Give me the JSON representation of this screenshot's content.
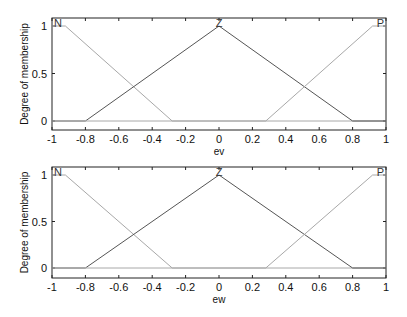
{
  "chart_data": [
    {
      "type": "line",
      "title": "",
      "xlabel": "ev",
      "ylabel": "Degree of membership",
      "xlim": [
        -1,
        1
      ],
      "ylim": [
        0,
        1
      ],
      "xticks": [
        "-1",
        "-0.8",
        "-0.6",
        "-0.4",
        "-0.2",
        "0",
        "0.2",
        "0.4",
        "0.6",
        "0.8",
        "1"
      ],
      "yticks": [
        "0",
        "0.5",
        "1"
      ],
      "grid": false,
      "series": [
        {
          "name": "N",
          "x": [
            -1,
            -0.92,
            -0.28,
            1
          ],
          "y": [
            1,
            1,
            0,
            0
          ],
          "color": "#a8a8a8"
        },
        {
          "name": "Z",
          "x": [
            -1,
            -0.8,
            0,
            0.8,
            1
          ],
          "y": [
            0,
            0,
            1,
            0,
            0
          ],
          "color": "#555555"
        },
        {
          "name": "P",
          "x": [
            -1,
            0.28,
            0.92,
            1
          ],
          "y": [
            0,
            0,
            1,
            1
          ],
          "color": "#a8a8a8"
        }
      ]
    },
    {
      "type": "line",
      "title": "",
      "xlabel": "ew",
      "ylabel": "Degree of membership",
      "xlim": [
        -1,
        1
      ],
      "ylim": [
        0,
        1
      ],
      "xticks": [
        "-1",
        "-0.8",
        "-0.6",
        "-0.4",
        "-0.2",
        "0",
        "0.2",
        "0.4",
        "0.6",
        "0.8",
        "1"
      ],
      "yticks": [
        "0",
        "0.5",
        "1"
      ],
      "grid": false,
      "series": [
        {
          "name": "N",
          "x": [
            -1,
            -0.92,
            -0.28,
            1
          ],
          "y": [
            1,
            1,
            0,
            0
          ],
          "color": "#a8a8a8"
        },
        {
          "name": "Z",
          "x": [
            -1,
            -0.8,
            0,
            0.8,
            1
          ],
          "y": [
            0,
            0,
            1,
            0,
            0
          ],
          "color": "#555555"
        },
        {
          "name": "P",
          "x": [
            -1,
            0.28,
            0.92,
            1
          ],
          "y": [
            0,
            0,
            1,
            1
          ],
          "color": "#a8a8a8"
        }
      ]
    }
  ]
}
